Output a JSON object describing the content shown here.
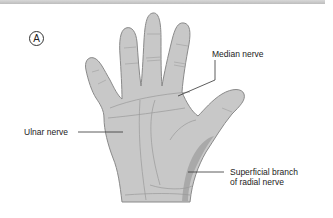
{
  "figure": {
    "panel_label": "A",
    "labels": {
      "median": "Median nerve",
      "ulnar": "Ulnar nerve",
      "radial_line1": "Superficial branch",
      "radial_line2": "of radial nerve"
    },
    "colors": {
      "skin_fill": "#c8c8c8",
      "outline": "#8a8a8a",
      "radial_region": "#a9a9a9",
      "leader_line": "#333333",
      "text": "#222222"
    }
  }
}
